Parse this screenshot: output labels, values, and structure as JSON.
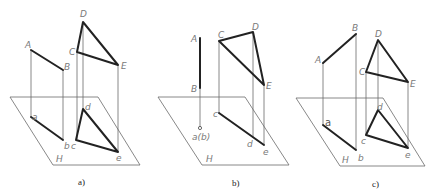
{
  "figure": {
    "panels": [
      {
        "caption": "a)",
        "plane_label": "H",
        "points": {
          "A": {
            "label": "A"
          },
          "B": {
            "label": "B"
          },
          "C": {
            "label": "C"
          },
          "D": {
            "label": "D"
          },
          "E": {
            "label": "E"
          },
          "a": {
            "label": "a"
          },
          "b": {
            "label": "b"
          },
          "c": {
            "label": "c"
          },
          "d": {
            "label": "d"
          },
          "e": {
            "label": "e"
          }
        }
      },
      {
        "caption": "b)",
        "plane_label": "H",
        "points": {
          "A": {
            "label": "A"
          },
          "B": {
            "label": "B"
          },
          "C": {
            "label": "C"
          },
          "D": {
            "label": "D"
          },
          "E": {
            "label": "E"
          },
          "ab": {
            "label": "a(b)"
          },
          "c": {
            "label": "c"
          },
          "d": {
            "label": "d"
          },
          "e": {
            "label": "e"
          }
        }
      },
      {
        "caption": "c)",
        "plane_label": "H",
        "points": {
          "A": {
            "label": "A"
          },
          "B": {
            "label": "B"
          },
          "C": {
            "label": "C"
          },
          "D": {
            "label": "D"
          },
          "E": {
            "label": "E"
          },
          "a": {
            "label": "a"
          },
          "b": {
            "label": "b"
          },
          "c": {
            "label": "c"
          },
          "d": {
            "label": "d"
          },
          "e": {
            "label": "e"
          }
        }
      }
    ],
    "colors": {
      "thick_line": "#222222",
      "thin_line": "#6a6a6a",
      "label": "#7a7a7a"
    }
  }
}
